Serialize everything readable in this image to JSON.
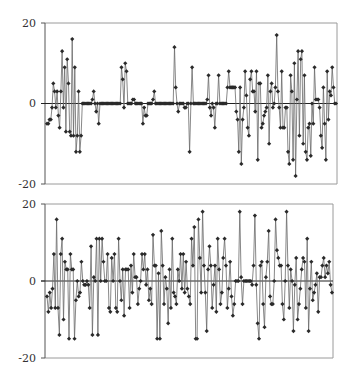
{
  "chart_data": [
    {
      "type": "line",
      "title": "",
      "xlabel": "",
      "ylabel": "",
      "ylim": [
        -20,
        20
      ],
      "yticks": [
        20,
        0,
        -20
      ],
      "ytick_labels": [
        "20",
        "0",
        "-20"
      ],
      "grid": false,
      "legend": null,
      "marker": "diamond",
      "zero_line": true,
      "values": [
        -5,
        -5,
        -4,
        -4,
        -1,
        5,
        3,
        -1,
        3,
        -3,
        -6,
        3,
        13,
        -1,
        9,
        -7,
        11,
        5,
        -7,
        -8,
        16,
        -8,
        9,
        -12,
        -8,
        3,
        -12,
        -8,
        0,
        0,
        0,
        0,
        0,
        0,
        0,
        0,
        1,
        3,
        0,
        -2,
        0,
        -5,
        0,
        0,
        0,
        0,
        0,
        0,
        0,
        0,
        0,
        0,
        0,
        0,
        0,
        0,
        0,
        0,
        0,
        9,
        6,
        -1,
        10,
        8,
        0,
        0,
        0,
        0,
        1,
        1,
        0,
        0,
        0,
        0,
        0,
        0,
        -5,
        -1,
        -3,
        -3,
        0,
        0,
        0,
        0,
        1,
        3,
        0,
        0,
        0,
        0,
        0,
        0,
        0,
        0,
        0,
        0,
        0,
        0,
        0,
        0,
        0,
        14,
        4,
        0,
        -2,
        0,
        0,
        0,
        0,
        -1,
        -1,
        0,
        0,
        -12,
        0,
        9,
        0,
        0,
        0,
        0,
        0,
        0,
        0,
        0,
        0,
        0,
        0,
        1,
        7,
        -1,
        -3,
        0,
        -1,
        -6,
        0,
        0,
        7,
        0,
        0,
        0,
        0,
        0,
        0,
        4,
        8,
        4,
        4,
        4,
        4,
        4,
        -2,
        -4,
        -12,
        4,
        -15,
        -4,
        -1,
        8,
        2,
        -6,
        -8,
        6,
        8,
        3,
        3,
        -2,
        8,
        -14,
        5,
        5,
        -6,
        -5,
        -3,
        -2,
        -1,
        7,
        -10,
        3,
        5,
        -1,
        0,
        4,
        17,
        3,
        -1,
        -6,
        8,
        -6,
        -6,
        -1,
        -1,
        -12,
        -15,
        7,
        3,
        -14,
        10,
        -18,
        1,
        13,
        -8,
        11,
        13,
        -10,
        7,
        -12,
        -14,
        -6,
        -5,
        -13,
        0,
        -5,
        9,
        1,
        1,
        1,
        -1,
        -8,
        -11,
        4,
        -5,
        -14,
        8,
        -4,
        3,
        2,
        9,
        4,
        0,
        0
      ]
    },
    {
      "type": "line",
      "title": "",
      "xlabel": "",
      "ylabel": "",
      "ylim": [
        -20,
        20
      ],
      "yticks": [
        20,
        0,
        -20
      ],
      "ytick_labels": [
        "20",
        "0",
        "-20"
      ],
      "grid": false,
      "legend": null,
      "marker": "diamond",
      "zero_line": true,
      "values": [
        -4,
        -8,
        -3,
        -7,
        -2,
        7,
        -7,
        16,
        -7,
        -14,
        7,
        11,
        -10,
        5,
        3,
        3,
        -15,
        7,
        3,
        3,
        -15,
        -5,
        0,
        -4,
        -3,
        5,
        0,
        -1,
        -1,
        0,
        -1,
        -7,
        9,
        -14,
        1,
        0,
        11,
        -14,
        11,
        0,
        11,
        5,
        0,
        0,
        7,
        -7,
        -8,
        6,
        0,
        7,
        -7,
        -8,
        11,
        0,
        -5,
        3,
        -9,
        3,
        3,
        3,
        -7,
        4,
        -3,
        7,
        1,
        1,
        -6,
        -2,
        0,
        7,
        3,
        7,
        -1,
        3,
        -5,
        -2,
        -6,
        12,
        4,
        4,
        -15,
        2,
        -15,
        13,
        4,
        -6,
        1,
        -2,
        -11,
        3,
        -7,
        11,
        -3,
        -4,
        -6,
        3,
        0,
        7,
        -2,
        7,
        -3,
        5,
        -2,
        -4,
        -6,
        11,
        4,
        14,
        -15,
        -15,
        16,
        6,
        -3,
        18,
        4,
        -3,
        -13,
        3,
        9,
        4,
        -7,
        -1,
        4,
        -8,
        11,
        3,
        -6,
        -3,
        6,
        11,
        4,
        -7,
        -2,
        5,
        -4,
        -9,
        -6,
        0,
        0,
        0,
        18,
        1,
        -6,
        0,
        0,
        0,
        0,
        0,
        0,
        -1,
        4,
        17,
        -1,
        -11,
        -15,
        4,
        5,
        -6,
        -12,
        1,
        5,
        13,
        -4,
        -6,
        -6,
        0,
        16,
        8,
        6,
        4,
        4,
        -6,
        -10,
        0,
        18,
        4,
        -7,
        3,
        0,
        -13,
        -1,
        6,
        -10,
        -6,
        -2,
        3,
        6,
        5,
        -7,
        11,
        -13,
        -2,
        5,
        -5,
        -3,
        -1,
        2,
        -8,
        1,
        1,
        4,
        6,
        1,
        4,
        2,
        5,
        -1,
        -3
      ]
    }
  ]
}
